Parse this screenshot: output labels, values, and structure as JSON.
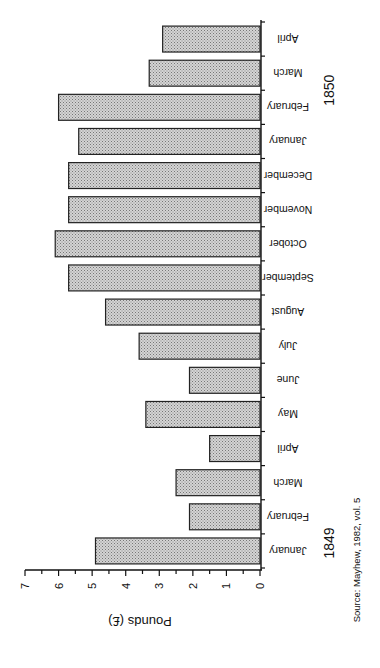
{
  "chart_data": {
    "type": "bar",
    "orientation": "rotated-90-counterclockwise",
    "title": "",
    "ylabel": "Pounds (£)",
    "xlabel": "",
    "ylim": [
      0,
      7
    ],
    "y_ticks": [
      "0",
      "1",
      "2",
      "3",
      "4",
      "5",
      "6",
      "7"
    ],
    "grid": false,
    "categories": [
      "January",
      "February",
      "March",
      "April",
      "May",
      "June",
      "July",
      "August",
      "September",
      "October",
      "November",
      "December",
      "January",
      "February",
      "March",
      "April"
    ],
    "year_groups": [
      {
        "label": "1849",
        "from_index": 0,
        "to_index": 3
      },
      {
        "label": "1850",
        "from_index": 12,
        "to_index": 15
      }
    ],
    "series": [
      {
        "name": "Pounds",
        "values": [
          4.9,
          2.1,
          2.5,
          1.5,
          3.4,
          2.1,
          3.6,
          4.6,
          5.7,
          6.1,
          5.7,
          5.7,
          5.4,
          6.0,
          3.3,
          2.9
        ]
      }
    ],
    "source_note": "Source: Mayhew, 1982, vol. 5",
    "bar_fill": "#bdbdbd",
    "bar_stroke": "#222222"
  }
}
